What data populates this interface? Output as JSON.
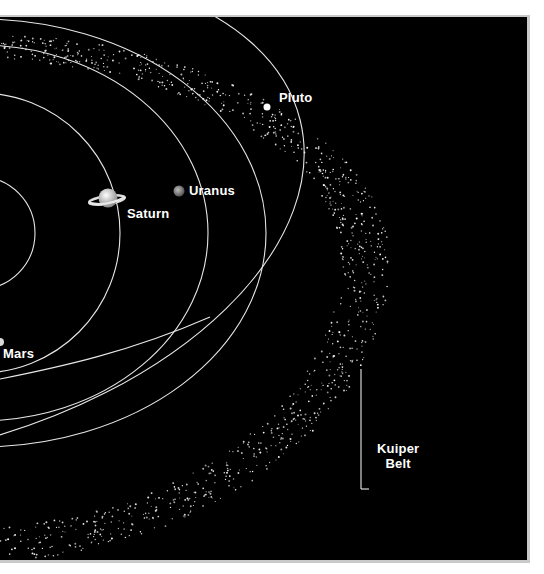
{
  "figure": {
    "type": "outer solar system diagram",
    "background_color": "#000000",
    "orbit_color": "#e6e6e6",
    "dot_color": "#ffffff",
    "frame_color": "#c9c9c9"
  },
  "labels": {
    "pluto": "Pluto",
    "uranus": "Uranus",
    "saturn": "Saturn",
    "mars": "Mars",
    "kuiper_line1": "Kuiper",
    "kuiper_line2": "Belt"
  },
  "bodies": [
    {
      "name": "Pluto",
      "icon": "pluto-dot-icon"
    },
    {
      "name": "Uranus",
      "icon": "uranus-planet-icon"
    },
    {
      "name": "Saturn",
      "icon": "saturn-ringed-planet-icon"
    },
    {
      "name": "Mars",
      "icon": "mars-planet-icon"
    }
  ],
  "regions": [
    {
      "name": "Kuiper Belt",
      "style": "scattered dots band"
    }
  ]
}
